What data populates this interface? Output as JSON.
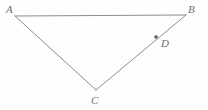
{
  "figure": {
    "kind": "geometry-diagram",
    "shape": "triangle",
    "canvas": {
      "width": 208,
      "height": 110
    },
    "background_color": "#fefefe",
    "stroke_color": "#8c8c8c",
    "stroke_width": 1,
    "label_color": "#6e6e6e",
    "marker_color": "#555555",
    "vertices": [
      {
        "id": "A",
        "label": "A",
        "x": 15,
        "y": 16,
        "label_x": 6,
        "label_y": 4
      },
      {
        "id": "B",
        "label": "B",
        "x": 186,
        "y": 15,
        "label_x": 188,
        "label_y": 4
      },
      {
        "id": "C",
        "label": "C",
        "x": 96,
        "y": 90,
        "label_x": 91,
        "label_y": 95
      }
    ],
    "points": [
      {
        "id": "D",
        "label": "D",
        "x": 156,
        "y": 37,
        "on_segment": "BC",
        "marker": "filled-square",
        "marker_size": 3,
        "label_x": 161,
        "label_y": 38
      }
    ],
    "edges": [
      {
        "id": "AB",
        "from": "A",
        "to": "B"
      },
      {
        "id": "AC",
        "from": "A",
        "to": "C"
      },
      {
        "id": "CB",
        "from": "C",
        "to": "B"
      }
    ]
  }
}
